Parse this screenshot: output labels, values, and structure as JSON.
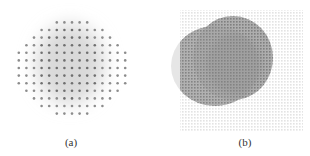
{
  "figure": {
    "panels": [
      {
        "id": "a",
        "caption": "(a)",
        "description": "sparse regular dot grid over soft gray blob",
        "dot_color": "#7a7a7a",
        "blob_color": "#d6d6d6",
        "dot_spacing_px": 7.6,
        "dot_radius_px": 1.3
      },
      {
        "id": "b",
        "caption": "(b)",
        "description": "dense fine point grid with two overlapping gray circular regions",
        "grid_color": "#e2e2e2",
        "circle_colors": [
          "#9a9a9a",
          "#b4b4b4"
        ],
        "grid_spacing_px": 3
      }
    ]
  }
}
